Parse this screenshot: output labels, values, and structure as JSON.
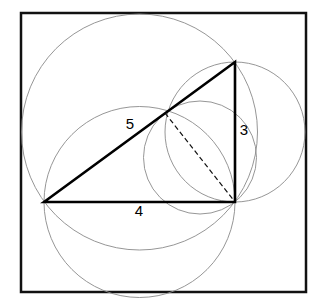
{
  "figure": {
    "background_color": "#ffffff",
    "stroke_color": "#000000",
    "thin_stroke_color": "#808080",
    "canvas": {
      "width": 328,
      "height": 308
    }
  },
  "frame": {
    "name": "outer-square-border",
    "x": 21,
    "y": 13,
    "width": 285,
    "height": 279,
    "stroke_width": 2.5
  },
  "triangle": {
    "name": "right-triangle",
    "stroke_width": 2.6,
    "vertices": {
      "left": {
        "x": 44,
        "y": 202
      },
      "top_right": {
        "x": 235,
        "y": 62
      },
      "bottom_right": {
        "x": 235,
        "y": 202
      }
    },
    "right_angle_at": "bottom_right"
  },
  "labels": [
    {
      "text": "5",
      "x": 130,
      "y": 125,
      "side": "hypotenuse"
    },
    {
      "text": "3",
      "x": 244,
      "y": 131,
      "side": "vertical-leg"
    },
    {
      "text": "4",
      "x": 139,
      "y": 212,
      "side": "horizontal-leg"
    }
  ],
  "altitude": {
    "name": "altitude-dashed-line",
    "from": {
      "x": 165,
      "y": 113
    },
    "to": {
      "x": 235,
      "y": 202
    },
    "dash_pattern": "5,3",
    "stroke_width": 1.2
  },
  "circles": [
    {
      "name": "circle-on-hypotenuse",
      "cx": 139.5,
      "cy": 132,
      "r": 118,
      "diameter_side": "5",
      "stroke_width": 0.9
    },
    {
      "name": "circle-on-horizontal-leg",
      "cx": 139.5,
      "cy": 202,
      "r": 95.5,
      "diameter_side": "4",
      "stroke_width": 0.9
    },
    {
      "name": "circle-on-vertical-leg",
      "cx": 235,
      "cy": 132,
      "r": 70,
      "diameter_side": "3",
      "stroke_width": 0.9
    },
    {
      "name": "circle-on-altitude",
      "cx": 200,
      "cy": 157.5,
      "r": 56.5,
      "diameter_side": "altitude",
      "stroke_width": 0.9
    }
  ],
  "chart_data": {
    "type": "diagram",
    "shape": "right triangle",
    "side_labels": [
      "5",
      "3",
      "4"
    ],
    "sides": [
      {
        "label": "5",
        "role": "hypotenuse",
        "value": 5
      },
      {
        "label": "4",
        "role": "base-leg",
        "value": 4
      },
      {
        "label": "3",
        "role": "vertical-leg",
        "value": 3
      }
    ],
    "circle_count": 4,
    "has_dashed_altitude": true
  }
}
